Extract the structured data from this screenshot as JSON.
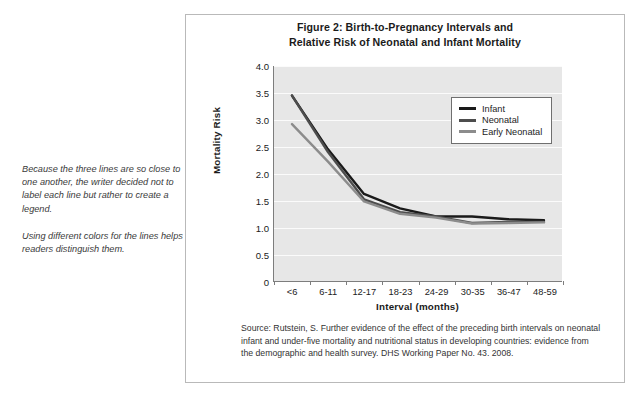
{
  "figure": {
    "title_line1": "Figure 2: Birth-to-Pregnancy Intervals and",
    "title_line2": "Relative Risk of Neonatal and Infant Mortality",
    "source": "Source: Rutstein, S. Further evidence of the effect of the preceding birth intervals on neonatal infant and under-five mortality and nutritional status in developing countries: evidence from the demographic and health survey. DHS Working Paper No. 43. 2008."
  },
  "annotations": [
    {
      "id": "annot-legend",
      "text": "Because the three lines are so close to one another, the writer decided not to label each line but rather to create a legend."
    },
    {
      "id": "annot-colors",
      "text": "Using different colors for the lines helps readers distinguish them."
    }
  ],
  "colors": {
    "infant": "#1a1a1a",
    "neonatal": "#4d4d4d",
    "early_neonatal": "#8c8c8c",
    "plot_background": "#e7e7e7",
    "gridline": "#fbfbfb",
    "axis": "#7d7d7d",
    "figure_border": "#b9b9b9",
    "leader_line": "#8a8a8a"
  },
  "chart_data": {
    "type": "line",
    "title": "Figure 2: Birth-to-Pregnancy Intervals and Relative Risk of Neonatal and Infant Mortality",
    "xlabel": "Interval (months)",
    "ylabel": "Mortality Risk",
    "categories": [
      "<6",
      "6-11",
      "12-17",
      "18-23",
      "24-29",
      "30-35",
      "36-47",
      "48-59"
    ],
    "ylim": [
      0,
      4.0
    ],
    "yticks": [
      "0",
      "0.5",
      "1.0",
      "1.5",
      "2.0",
      "2.5",
      "3.0",
      "3.5",
      "4.0"
    ],
    "ytick_values": [
      0,
      0.5,
      1.0,
      1.5,
      2.0,
      2.5,
      3.0,
      3.5,
      4.0
    ],
    "grid": true,
    "legend_position": "upper right",
    "series": [
      {
        "name": "Infant",
        "values": [
          3.45,
          2.45,
          1.62,
          1.35,
          1.2,
          1.2,
          1.15,
          1.13
        ]
      },
      {
        "name": "Neonatal",
        "values": [
          3.45,
          2.4,
          1.52,
          1.28,
          1.2,
          1.08,
          1.1,
          1.1
        ]
      },
      {
        "name": "Early Neonatal",
        "values": [
          2.92,
          2.22,
          1.48,
          1.25,
          1.18,
          1.07,
          1.08,
          1.09
        ]
      }
    ]
  }
}
